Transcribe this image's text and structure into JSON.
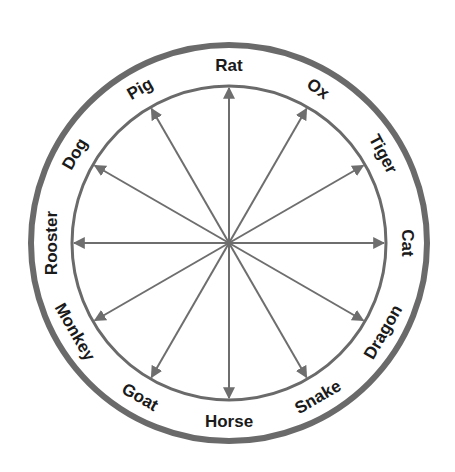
{
  "diagram": {
    "type": "zodiac-wheel",
    "center": [
      229,
      243
    ],
    "outer_radius": 198,
    "inner_radius": 157,
    "label_radius": 178,
    "colors": {
      "ring": "#6a6a6a",
      "arrow": "#6e6e6e",
      "text": "#1a1a1a"
    },
    "animals": [
      {
        "label": "Rat",
        "angle": 0,
        "rot": 0
      },
      {
        "label": "Ox",
        "angle": 30,
        "rot": 35
      },
      {
        "label": "Tiger",
        "angle": 60,
        "rot": 62
      },
      {
        "label": "Cat",
        "angle": 90,
        "rot": 90
      },
      {
        "label": "Dragon",
        "angle": 120,
        "rot": -60
      },
      {
        "label": "Snake",
        "angle": 150,
        "rot": -30
      },
      {
        "label": "Horse",
        "angle": 180,
        "rot": 0
      },
      {
        "label": "Goat",
        "angle": 210,
        "rot": 30
      },
      {
        "label": "Monkey",
        "angle": 240,
        "rot": 60
      },
      {
        "label": "Rooster",
        "angle": 270,
        "rot": -90
      },
      {
        "label": "Dog",
        "angle": 300,
        "rot": -60
      },
      {
        "label": "Pig",
        "angle": 330,
        "rot": -30
      }
    ]
  }
}
